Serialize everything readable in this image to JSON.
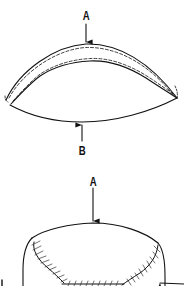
{
  "diagram": {
    "figures": [
      {
        "id": "top-view",
        "description": "Curved crescent piece with dashed stitching lines along the top band",
        "labels": [
          {
            "text": "A",
            "position": "top",
            "arrow": "down"
          },
          {
            "text": "B",
            "position": "bottom",
            "arrow": "up"
          }
        ]
      },
      {
        "id": "bottom-view",
        "description": "Dome-shaped piece with cross-hatched seam stitches",
        "labels": [
          {
            "text": "A",
            "position": "top",
            "arrow": "down"
          }
        ]
      }
    ],
    "colors": {
      "line": "#111111",
      "background": "#ffffff"
    }
  },
  "labels": {
    "top_a": "A",
    "top_b": "B",
    "bottom_a": "A"
  }
}
